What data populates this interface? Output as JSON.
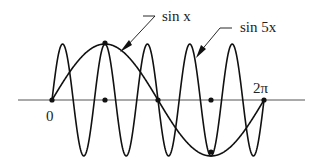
{
  "diagram": {
    "labels": {
      "sin_x": "sin x",
      "sin_5x": "sin 5x",
      "zero": "0",
      "two_pi": "2π"
    },
    "curves": [
      {
        "name": "sin x",
        "frequency": 1
      },
      {
        "name": "sin 5x",
        "frequency": 5
      }
    ],
    "x_range": [
      "0",
      "2π"
    ],
    "colors": {
      "stroke": "#111111",
      "axis": "#555555"
    }
  }
}
